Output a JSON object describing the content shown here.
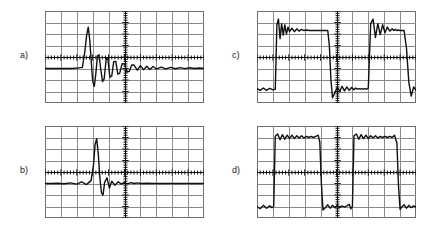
{
  "figure": {
    "background_color": "#ffffff",
    "trace_color": "#101010",
    "grid_color": "#8a8a8a",
    "border_color": "#6f6f6f",
    "panel_count": 4,
    "layout": "2x2"
  },
  "panels": [
    {
      "id": "a",
      "label": "a)",
      "label_x": 20,
      "label_y": 50,
      "scope_x": 45,
      "scope_y": 11,
      "scope_w": 159,
      "scope_h": 92,
      "divisions_x": 10,
      "divisions_y": 8,
      "waveform_kind": "impulse-response",
      "baseline_div": 3.0,
      "description": "Damped impulse with large positive overshoot and decaying ringing"
    },
    {
      "id": "b",
      "label": "b)",
      "label_x": 20,
      "label_y": 165,
      "scope_x": 45,
      "scope_y": 126,
      "scope_w": 159,
      "scope_h": 92,
      "divisions_x": 10,
      "divisions_y": 8,
      "waveform_kind": "impulse-response",
      "baseline_div": 3.0,
      "description": "Narrow sharp impulse with fast-settling low ringing"
    },
    {
      "id": "c",
      "label": "c)",
      "label_x": 232,
      "label_y": 50,
      "scope_x": 257,
      "scope_y": 11,
      "scope_w": 159,
      "scope_h": 92,
      "divisions_x": 10,
      "divisions_y": 8,
      "baseline_div": 4.0,
      "waveform_kind": "square-wave-response",
      "description": "Square wave with strong overshoot and ringing on rising edges, undershoot on falling edges"
    },
    {
      "id": "d",
      "label": "d)",
      "label_x": 232,
      "label_y": 165,
      "scope_x": 257,
      "scope_y": 126,
      "scope_w": 159,
      "scope_h": 92,
      "divisions_x": 10,
      "divisions_y": 8,
      "baseline_div": 4.0,
      "waveform_kind": "square-wave-response",
      "description": "Square wave with flat tops, small ripple and steep clean edges"
    }
  ],
  "chart_data": [
    {
      "type": "line",
      "title": "a)",
      "xlabel": "",
      "ylabel": "",
      "xlim": [
        0,
        10
      ],
      "ylim": [
        0,
        8
      ],
      "grid": true,
      "legend": "none",
      "x_divisions": 10,
      "y_divisions": 8,
      "baseline": 3.0,
      "series": [
        {
          "name": "impulse-response-a",
          "x": [
            0.0,
            0.3,
            0.6,
            0.9,
            1.2,
            1.5,
            1.8,
            2.1,
            2.35,
            2.5,
            2.62,
            2.72,
            2.82,
            2.92,
            3.0,
            3.1,
            3.2,
            3.3,
            3.4,
            3.5,
            3.62,
            3.72,
            3.85,
            3.95,
            4.08,
            4.2,
            4.32,
            4.45,
            4.58,
            4.7,
            4.85,
            5.0,
            5.15,
            5.3,
            5.45,
            5.6,
            5.8,
            6.0,
            6.2,
            6.4,
            6.6,
            6.8,
            7.0,
            7.3,
            7.6,
            7.9,
            8.2,
            8.5,
            8.8,
            9.1,
            9.4,
            9.7,
            10.0
          ],
          "y": [
            3.0,
            3.0,
            3.0,
            3.0,
            3.0,
            3.0,
            3.02,
            3.05,
            3.1,
            4.4,
            5.9,
            6.6,
            5.4,
            3.4,
            1.9,
            1.45,
            2.6,
            4.1,
            4.2,
            3.0,
            1.85,
            2.1,
            3.85,
            3.9,
            2.25,
            2.35,
            3.6,
            3.62,
            2.5,
            2.6,
            3.42,
            3.4,
            2.7,
            2.75,
            3.3,
            3.3,
            2.85,
            3.25,
            2.9,
            3.2,
            2.92,
            3.18,
            2.95,
            3.12,
            2.96,
            3.1,
            2.98,
            3.08,
            2.99,
            3.06,
            3.0,
            3.04,
            3.0
          ]
        }
      ]
    },
    {
      "type": "line",
      "title": "b)",
      "xlabel": "",
      "ylabel": "",
      "xlim": [
        0,
        10
      ],
      "ylim": [
        0,
        8
      ],
      "grid": true,
      "legend": "none",
      "x_divisions": 10,
      "y_divisions": 8,
      "baseline": 3.0,
      "series": [
        {
          "name": "impulse-response-b",
          "x": [
            0.0,
            0.4,
            0.8,
            1.2,
            1.6,
            2.0,
            2.3,
            2.6,
            2.9,
            3.05,
            3.15,
            3.25,
            3.35,
            3.45,
            3.55,
            3.65,
            3.75,
            3.9,
            4.05,
            4.2,
            4.4,
            4.6,
            4.8,
            5.0,
            5.2,
            5.4,
            5.6,
            5.8,
            6.0,
            6.4,
            6.8,
            7.2,
            7.6,
            8.0,
            8.5,
            9.0,
            9.5,
            10.0
          ],
          "y": [
            3.0,
            3.0,
            3.02,
            2.98,
            3.05,
            2.95,
            3.15,
            2.9,
            3.25,
            4.6,
            6.4,
            6.9,
            5.6,
            3.5,
            2.2,
            2.0,
            3.1,
            3.5,
            2.6,
            3.2,
            2.85,
            3.15,
            2.95,
            3.1,
            2.97,
            3.08,
            3.0,
            3.05,
            3.0,
            3.02,
            3.0,
            3.01,
            3.0,
            3.0,
            3.0,
            3.0,
            3.0,
            3.0
          ]
        }
      ]
    },
    {
      "type": "line",
      "title": "c)",
      "xlabel": "",
      "ylabel": "",
      "xlim": [
        0,
        10
      ],
      "ylim": [
        0,
        8
      ],
      "grid": true,
      "legend": "none",
      "x_divisions": 10,
      "y_divisions": 8,
      "baseline": 4.0,
      "high_level": 6.3,
      "low_level": 1.2,
      "series": [
        {
          "name": "square-wave-response-c",
          "x": [
            0.0,
            0.2,
            0.4,
            0.6,
            0.8,
            1.0,
            1.15,
            1.25,
            1.35,
            1.45,
            1.55,
            1.65,
            1.75,
            1.85,
            1.95,
            2.05,
            2.2,
            2.35,
            2.5,
            2.65,
            2.8,
            2.95,
            3.1,
            3.3,
            3.5,
            3.7,
            3.9,
            4.1,
            4.3,
            4.45,
            4.55,
            4.65,
            4.75,
            4.9,
            5.05,
            5.2,
            5.35,
            5.5,
            5.65,
            5.8,
            5.95,
            6.1,
            6.2,
            6.3,
            6.4,
            6.5,
            6.6,
            6.7,
            6.8,
            6.9,
            7.0,
            7.15,
            7.3,
            7.45,
            7.6,
            7.75,
            7.9,
            8.05,
            8.2,
            8.35,
            8.5,
            8.6,
            8.7,
            8.8,
            8.9,
            9.0,
            9.1,
            9.25,
            9.4,
            9.55,
            9.7,
            9.85,
            10.0
          ],
          "y": [
            1.25,
            1.1,
            1.3,
            1.1,
            1.28,
            1.15,
            1.2,
            6.8,
            7.3,
            5.6,
            6.9,
            5.9,
            6.8,
            6.0,
            6.6,
            6.2,
            6.5,
            6.2,
            6.45,
            6.25,
            6.4,
            6.3,
            6.35,
            6.3,
            6.3,
            6.3,
            6.3,
            6.3,
            6.3,
            6.3,
            5.0,
            2.0,
            0.45,
            0.9,
            1.4,
            1.0,
            1.45,
            1.05,
            1.4,
            1.1,
            1.35,
            1.15,
            1.3,
            1.2,
            1.25,
            1.2,
            1.25,
            1.2,
            1.25,
            1.2,
            1.3,
            6.9,
            7.3,
            5.7,
            6.9,
            5.95,
            6.8,
            6.1,
            6.6,
            6.25,
            6.45,
            6.3,
            6.4,
            6.3,
            6.35,
            6.3,
            6.3,
            6.3,
            4.8,
            1.8,
            0.6,
            1.4,
            1.1
          ]
        }
      ]
    },
    {
      "type": "line",
      "title": "d)",
      "xlabel": "",
      "ylabel": "",
      "xlim": [
        0,
        10
      ],
      "ylim": [
        0,
        8
      ],
      "grid": true,
      "legend": "none",
      "x_divisions": 10,
      "y_divisions": 8,
      "baseline": 4.0,
      "high_level": 7.0,
      "low_level": 0.9,
      "series": [
        {
          "name": "square-wave-response-d",
          "x": [
            0.0,
            0.2,
            0.4,
            0.6,
            0.8,
            0.95,
            1.05,
            1.15,
            1.3,
            1.45,
            1.6,
            1.75,
            1.9,
            2.05,
            2.2,
            2.35,
            2.5,
            2.65,
            2.8,
            2.95,
            3.1,
            3.25,
            3.4,
            3.55,
            3.7,
            3.85,
            3.95,
            4.05,
            4.15,
            4.3,
            4.45,
            4.6,
            4.75,
            4.9,
            5.05,
            5.2,
            5.35,
            5.5,
            5.65,
            5.8,
            5.9,
            6.0,
            6.1,
            6.25,
            6.4,
            6.55,
            6.7,
            6.85,
            7.0,
            7.15,
            7.3,
            7.45,
            7.6,
            7.75,
            7.9,
            8.05,
            8.2,
            8.35,
            8.5,
            8.65,
            8.8,
            8.9,
            9.0,
            9.1,
            9.25,
            9.4,
            9.55,
            9.7,
            9.85,
            10.0
          ],
          "y": [
            1.0,
            0.8,
            1.1,
            0.85,
            1.05,
            0.9,
            1.0,
            7.1,
            7.3,
            6.8,
            7.25,
            6.85,
            7.2,
            6.9,
            7.2,
            6.9,
            7.15,
            6.95,
            7.15,
            6.95,
            7.1,
            7.0,
            7.1,
            7.0,
            7.1,
            7.2,
            6.6,
            3.0,
            0.7,
            0.9,
            1.15,
            0.85,
            1.1,
            0.9,
            1.1,
            0.9,
            1.05,
            0.95,
            1.05,
            1.2,
            0.8,
            1.0,
            7.15,
            7.3,
            6.85,
            7.25,
            6.9,
            7.2,
            6.9,
            7.15,
            6.95,
            7.15,
            6.95,
            7.1,
            7.0,
            7.1,
            7.0,
            7.1,
            7.0,
            7.2,
            6.5,
            2.8,
            0.75,
            0.95,
            1.15,
            0.85,
            1.1,
            0.9,
            1.05,
            0.95
          ]
        }
      ]
    }
  ]
}
